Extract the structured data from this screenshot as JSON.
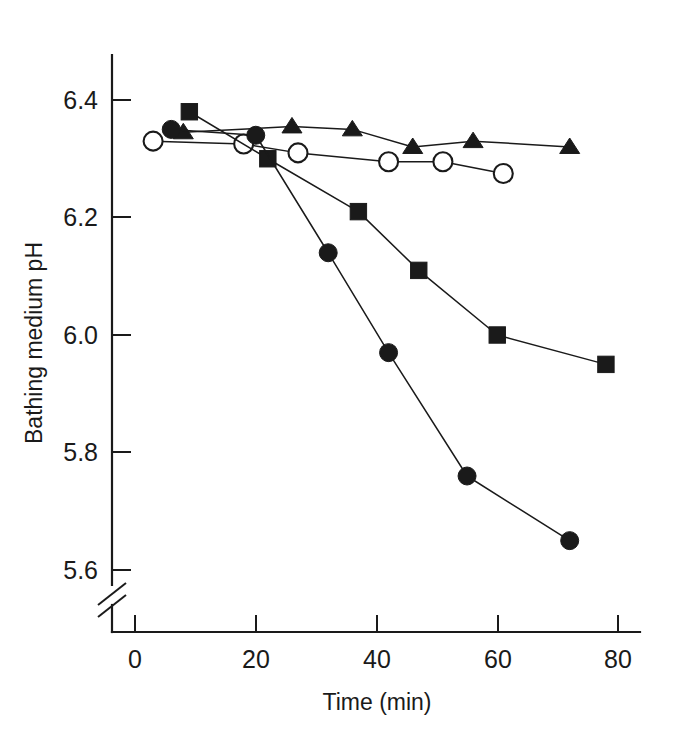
{
  "chart_data": {
    "type": "line",
    "title": "",
    "xlabel": "Time (min)",
    "ylabel": "Bathing medium pH",
    "xlim": [
      0,
      82
    ],
    "ylim": [
      5.55,
      6.47
    ],
    "yticks": [
      "6.4",
      "6.2",
      "6.0",
      "5.8",
      "5.6"
    ],
    "ytick_values": [
      6.4,
      6.2,
      6.0,
      5.8,
      5.6
    ],
    "xticks": [
      "0",
      "20",
      "40",
      "60",
      "80"
    ],
    "xtick_values": [
      0,
      20,
      40,
      60,
      80
    ],
    "grid": false,
    "legend": "none",
    "y_axis_break": true,
    "series": [
      {
        "name": "open-circle-series",
        "marker": "open-circle",
        "x": [
          3,
          18,
          27,
          42,
          51,
          61
        ],
        "y": [
          6.33,
          6.325,
          6.31,
          6.295,
          6.295,
          6.275
        ]
      },
      {
        "name": "filled-triangle-series",
        "marker": "filled-triangle",
        "x": [
          8,
          26,
          36,
          46,
          56,
          72
        ],
        "y": [
          6.345,
          6.355,
          6.35,
          6.32,
          6.33,
          6.32
        ]
      },
      {
        "name": "filled-square-series",
        "marker": "filled-square",
        "x": [
          9,
          22,
          37,
          47,
          60,
          78
        ],
        "y": [
          6.38,
          6.3,
          6.21,
          6.11,
          6.0,
          5.95
        ]
      },
      {
        "name": "filled-circle-series",
        "marker": "filled-circle",
        "x": [
          6,
          20,
          32,
          42,
          55,
          72
        ],
        "y": [
          6.35,
          6.34,
          6.14,
          5.97,
          5.76,
          5.65
        ]
      }
    ]
  },
  "axes": {
    "y_title": "Bathing medium pH",
    "x_title": "Time (min)"
  }
}
